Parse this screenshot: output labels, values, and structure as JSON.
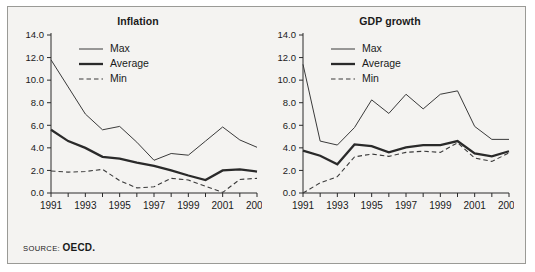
{
  "figure": {
    "source_label": "SOURCE:",
    "source_value": "OECD.",
    "background_color": "#f4f3f1",
    "border_color": "#9a9a96",
    "ink_color": "#2a2a2a"
  },
  "legend": {
    "max_label": "Max",
    "average_label": "Average",
    "min_label": "Min"
  },
  "chart_data": [
    {
      "type": "line",
      "title": "Inflation",
      "xlabel": "",
      "ylabel": "",
      "x": [
        1991,
        1992,
        1993,
        1994,
        1995,
        1996,
        1997,
        1998,
        1999,
        2000,
        2001,
        2002,
        2003
      ],
      "xtick_labels": [
        "1991",
        "",
        "1993",
        "",
        "1995",
        "",
        "1997",
        "",
        "1999",
        "",
        "2001",
        "",
        "2003"
      ],
      "ytick_labels": [
        "0.0",
        "2.0",
        "4.0",
        "6.0",
        "8.0",
        "10.0",
        "12.0",
        "14.0"
      ],
      "ylim": [
        0.0,
        14.0
      ],
      "ytick_step": 2.0,
      "grid": false,
      "legend_position": "top-left",
      "series": [
        {
          "name": "Max",
          "values": [
            11.8,
            9.4,
            7.0,
            5.6,
            5.9,
            4.5,
            2.9,
            3.5,
            3.35,
            4.6,
            5.85,
            4.7,
            4.05
          ]
        },
        {
          "name": "Average",
          "values": [
            5.6,
            4.6,
            4.0,
            3.2,
            3.05,
            2.7,
            2.4,
            2.0,
            1.55,
            1.15,
            2.0,
            2.1,
            1.9
          ]
        },
        {
          "name": "Min",
          "values": [
            1.95,
            1.85,
            1.9,
            2.1,
            1.1,
            0.45,
            0.55,
            1.3,
            1.15,
            0.6,
            0.05,
            1.2,
            1.3
          ]
        }
      ]
    },
    {
      "type": "line",
      "title": "GDP growth",
      "xlabel": "",
      "ylabel": "",
      "x": [
        1991,
        1992,
        1993,
        1994,
        1995,
        1996,
        1997,
        1998,
        1999,
        2000,
        2001,
        2002,
        2003
      ],
      "xtick_labels": [
        "1991",
        "",
        "1993",
        "",
        "1995",
        "",
        "1997",
        "",
        "1999",
        "",
        "2001",
        "",
        "2003"
      ],
      "ytick_labels": [
        "0.0",
        "2.0",
        "4.0",
        "6.0",
        "8.0",
        "10.0",
        "12.0",
        "14.0"
      ],
      "ylim": [
        0.0,
        14.0
      ],
      "ytick_step": 2.0,
      "grid": false,
      "legend_position": "top-left",
      "series": [
        {
          "name": "Max",
          "values": [
            11.4,
            4.6,
            4.25,
            5.8,
            8.25,
            7.05,
            8.75,
            7.45,
            8.75,
            9.05,
            5.9,
            4.75,
            4.75
          ]
        },
        {
          "name": "Average",
          "values": [
            3.75,
            3.3,
            2.55,
            4.3,
            4.15,
            3.6,
            4.05,
            4.25,
            4.25,
            4.6,
            3.5,
            3.25,
            3.7
          ]
        },
        {
          "name": "Min",
          "values": [
            0.0,
            0.9,
            1.45,
            3.2,
            3.45,
            3.25,
            3.6,
            3.7,
            3.6,
            4.45,
            3.1,
            2.8,
            3.55
          ]
        }
      ]
    }
  ]
}
